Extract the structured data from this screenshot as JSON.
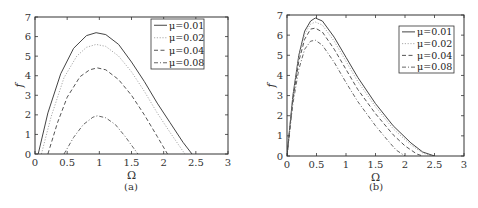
{
  "figure": {
    "captions": [
      "(a)",
      "(b)"
    ]
  },
  "chart_data": [
    {
      "type": "line",
      "panel": "(a)",
      "xlabel": "Ω",
      "ylabel": "f",
      "xlim": [
        0,
        3
      ],
      "ylim": [
        0,
        7
      ],
      "xticks": [
        0,
        0.5,
        1,
        1.5,
        2,
        2.5,
        3
      ],
      "xtick_labels": [
        "0",
        "0.5",
        "1",
        "1.5",
        "2",
        "2.5",
        "3"
      ],
      "yticks": [
        0,
        1,
        2,
        3,
        4,
        5,
        6,
        7
      ],
      "ytick_labels": [
        "0",
        "1",
        "2",
        "3",
        "4",
        "5",
        "6",
        "7"
      ],
      "grid": false,
      "legend_position": "upper right",
      "series": [
        {
          "name": "μ=0.01",
          "style": "solid",
          "color": "#444444",
          "x": [
            0.05,
            0.2,
            0.4,
            0.6,
            0.8,
            0.95,
            1.1,
            1.3,
            1.5,
            1.7,
            1.9,
            2.1,
            2.3,
            2.44
          ],
          "y": [
            0,
            2.1,
            4.1,
            5.4,
            6.05,
            6.2,
            6.1,
            5.6,
            4.7,
            3.7,
            2.6,
            1.6,
            0.6,
            0
          ]
        },
        {
          "name": "μ=0.02",
          "style": "dotted",
          "color": "#aaaaaa",
          "x": [
            0.1,
            0.25,
            0.45,
            0.65,
            0.8,
            0.95,
            1.1,
            1.3,
            1.5,
            1.7,
            1.9,
            2.1,
            2.33
          ],
          "y": [
            0,
            1.9,
            3.9,
            5.0,
            5.45,
            5.6,
            5.5,
            5.0,
            4.2,
            3.2,
            2.1,
            1.1,
            0
          ]
        },
        {
          "name": "μ=0.04",
          "style": "dashed",
          "color": "#555555",
          "x": [
            0.2,
            0.35,
            0.5,
            0.7,
            0.85,
            0.97,
            1.1,
            1.3,
            1.5,
            1.7,
            1.9,
            2.06
          ],
          "y": [
            0,
            1.6,
            2.9,
            3.95,
            4.3,
            4.4,
            4.3,
            3.8,
            3.0,
            2.0,
            0.9,
            0
          ]
        },
        {
          "name": "μ=0.08",
          "style": "dashdot",
          "color": "#666666",
          "x": [
            0.45,
            0.6,
            0.75,
            0.9,
            0.97,
            1.1,
            1.25,
            1.4,
            1.6
          ],
          "y": [
            0,
            0.85,
            1.5,
            1.88,
            1.95,
            1.85,
            1.5,
            0.9,
            0
          ]
        }
      ]
    },
    {
      "type": "line",
      "panel": "(b)",
      "xlabel": "Ω",
      "ylabel": "f",
      "xlim": [
        0,
        3
      ],
      "ylim": [
        0,
        7
      ],
      "xticks": [
        0,
        0.5,
        1,
        1.5,
        2,
        2.5,
        3
      ],
      "xtick_labels": [
        "0",
        "0.5",
        "1",
        "1.5",
        "2",
        "2.5",
        "3"
      ],
      "yticks": [
        0,
        1,
        2,
        3,
        4,
        5,
        6,
        7
      ],
      "ytick_labels": [
        "0",
        "1",
        "2",
        "3",
        "4",
        "5",
        "6",
        "7"
      ],
      "grid": false,
      "legend_position": "upper right",
      "series": [
        {
          "name": "μ=0.01",
          "style": "solid",
          "color": "#444444",
          "x": [
            0.0,
            0.05,
            0.1,
            0.2,
            0.3,
            0.4,
            0.48,
            0.6,
            0.8,
            1.0,
            1.2,
            1.5,
            1.8,
            2.1,
            2.3,
            2.5
          ],
          "y": [
            0,
            1.5,
            3.0,
            5.0,
            6.2,
            6.7,
            6.85,
            6.7,
            5.9,
            4.9,
            3.9,
            2.6,
            1.5,
            0.65,
            0.2,
            0
          ]
        },
        {
          "name": "μ=0.02",
          "style": "dotted",
          "color": "#aaaaaa",
          "x": [
            0.0,
            0.05,
            0.1,
            0.2,
            0.3,
            0.4,
            0.48,
            0.6,
            0.8,
            1.0,
            1.2,
            1.5,
            1.8,
            2.1,
            2.3,
            2.45
          ],
          "y": [
            0,
            1.45,
            2.9,
            4.9,
            6.05,
            6.55,
            6.65,
            6.5,
            5.7,
            4.7,
            3.7,
            2.45,
            1.35,
            0.55,
            0.15,
            0
          ]
        },
        {
          "name": "μ=0.04",
          "style": "dashed",
          "color": "#555555",
          "x": [
            0.0,
            0.05,
            0.1,
            0.2,
            0.3,
            0.4,
            0.48,
            0.6,
            0.8,
            1.0,
            1.2,
            1.5,
            1.8,
            2.0,
            2.2,
            2.3
          ],
          "y": [
            0,
            1.4,
            2.8,
            4.7,
            5.8,
            6.3,
            6.35,
            6.15,
            5.3,
            4.3,
            3.3,
            2.1,
            1.05,
            0.5,
            0.1,
            0
          ]
        },
        {
          "name": "μ=0.08",
          "style": "dashdot",
          "color": "#666666",
          "x": [
            0.0,
            0.05,
            0.1,
            0.2,
            0.3,
            0.4,
            0.48,
            0.6,
            0.8,
            1.0,
            1.2,
            1.5,
            1.7,
            1.85,
            2.0
          ],
          "y": [
            0,
            1.3,
            2.6,
            4.3,
            5.3,
            5.7,
            5.75,
            5.5,
            4.65,
            3.65,
            2.7,
            1.5,
            0.8,
            0.3,
            0
          ]
        }
      ]
    }
  ]
}
